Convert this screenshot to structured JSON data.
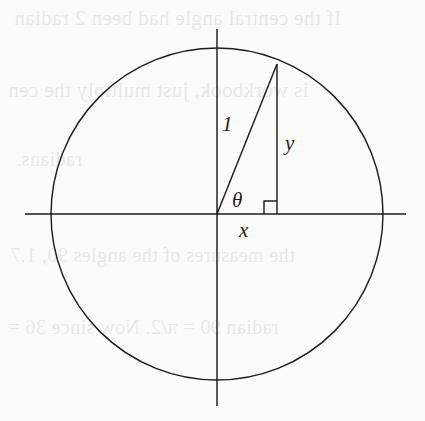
{
  "figure": {
    "background_color": "#fbfbfa",
    "stroke_color": "#1d1d1d",
    "labels": {
      "hypotenuse": "1",
      "vertical_leg": "y",
      "horizontal_leg": "x",
      "angle": "θ"
    },
    "geometry": {
      "center_x": 217,
      "center_y": 214,
      "radius": 166,
      "terminal_x": 277,
      "terminal_y": 64,
      "angle_degrees": 68,
      "x_axis_start": 25,
      "x_axis_end": 406,
      "y_axis_start": 29,
      "y_axis_end": 406,
      "right_angle_size": 13
    }
  },
  "bleed_through": {
    "description": "faint mirrored show-through text from reverse side of page",
    "lines": [
      {
        "text": "If the central angle had been 2 radian",
        "x": 14,
        "y": 6,
        "size": 21
      },
      {
        "text": "is workbook, just multiply the cen",
        "x": 8,
        "y": 78,
        "size": 21
      },
      {
        "text": "radians.",
        "x": 16,
        "y": 148,
        "size": 20
      },
      {
        "text": "the measures of the angles 90, 1.7",
        "x": 10,
        "y": 244,
        "size": 20
      },
      {
        "text": "radian 90 = π/2. Now since 36 =",
        "x": 8,
        "y": 316,
        "size": 20
      }
    ]
  }
}
